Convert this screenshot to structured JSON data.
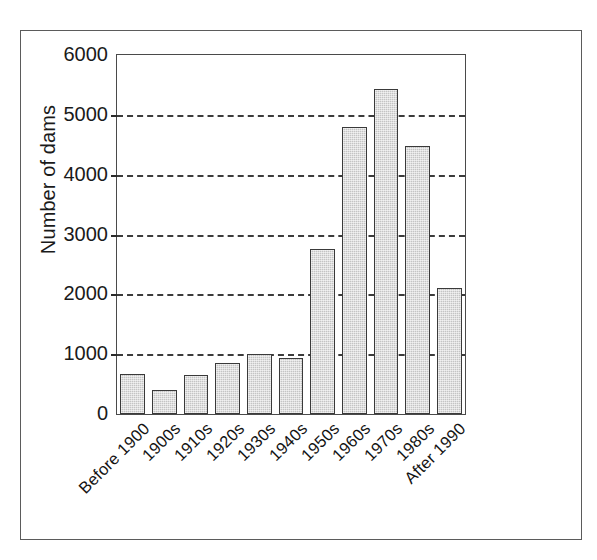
{
  "chart_data": {
    "type": "bar",
    "title": "",
    "subtitle": "",
    "xlabel": "",
    "ylabel": "Number of dams",
    "categories": [
      "Before 1900",
      "1900s",
      "1910s",
      "1920s",
      "1930s",
      "1940s",
      "1950s",
      "1960s",
      "1970s",
      "1980s",
      "After 1990"
    ],
    "values": [
      670,
      400,
      650,
      850,
      1010,
      930,
      2760,
      4800,
      5430,
      4480,
      2100
    ],
    "ylim": [
      0,
      6000
    ],
    "y_ticks": [
      0,
      1000,
      2000,
      3000,
      4000,
      5000,
      6000
    ],
    "y_tick_labels": [
      "0",
      "1000",
      "2000",
      "3000",
      "4000",
      "5000",
      "6000"
    ],
    "grid": "horizontal-dashed",
    "legend": "none",
    "bar_fill_color": "#c4c4c4",
    "bar_edge_color": "#3a3a3a",
    "gridline_color": "#2b2b2b",
    "axis_color": "#4a4a4a",
    "text_color": "#1a1a1a",
    "background_color": "#ffffff",
    "x_tick_label_rotation": -45
  }
}
